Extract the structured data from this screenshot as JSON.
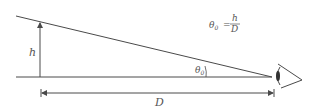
{
  "diagram": {
    "height_label": "h",
    "distance_label": "D",
    "angle_label": "θ",
    "angle_subscript": "0",
    "formula": {
      "lhs": "θ",
      "lhs_subscript": "0",
      "equals": "=",
      "numerator": "h",
      "denominator": "D"
    },
    "colors": {
      "line": "#4a4a4a",
      "text": "#555555",
      "background": "#ffffff"
    }
  }
}
